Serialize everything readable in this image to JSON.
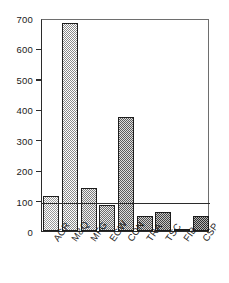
{
  "chart_data": {
    "type": "bar",
    "title": "",
    "subtitle": "",
    "xlabel": "",
    "ylabel": "",
    "categories": [
      "AGR",
      "M&Q",
      "MFG",
      "EGW",
      "CON",
      "TRA",
      "TSC",
      "FIB",
      "CSP"
    ],
    "values": [
      115,
      685,
      140,
      85,
      375,
      50,
      62,
      5,
      50
    ],
    "ylim": [
      0,
      700
    ],
    "yticks": [
      0,
      100,
      200,
      300,
      400,
      500,
      600,
      700
    ],
    "ytick_labels": [
      "0",
      "100",
      "200",
      "300",
      "400",
      "500",
      "600",
      "700"
    ],
    "grid": false,
    "legend": "none",
    "reference_line": {
      "value": 100,
      "label": ""
    },
    "bar_fills": [
      "fill-1",
      "fill-2",
      "fill-3",
      "fill-4",
      "fill-5",
      "fill-6",
      "fill-7",
      "fill-8",
      "fill-9"
    ],
    "colors": {
      "axis": "#2b2b2b",
      "frame_light": "#6e6e6e",
      "bar_outline": "#1c1c1c",
      "text": "#1a1a1a",
      "background": "#ffffff"
    }
  }
}
